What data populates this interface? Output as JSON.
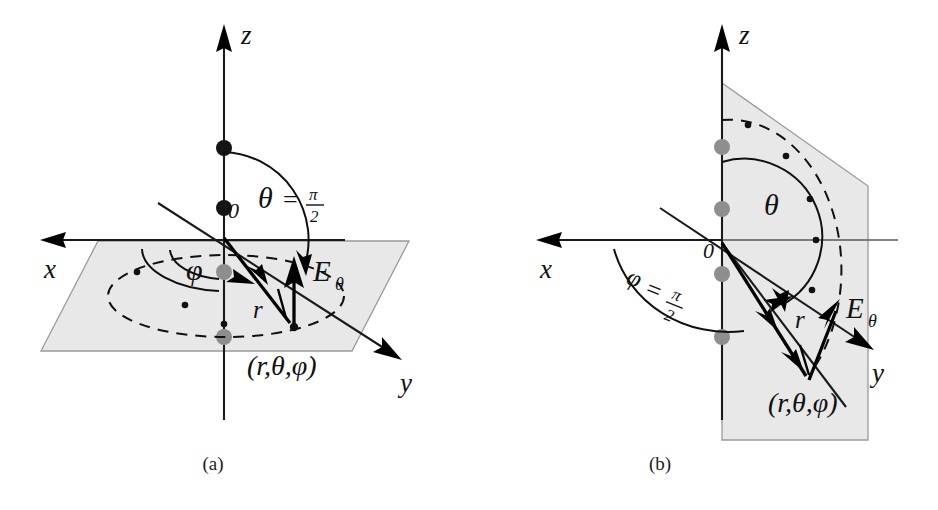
{
  "figure": {
    "background_color": "#ffffff",
    "plane_fill_color": "#e8e8e8",
    "plane_edge_color": "#9a9a9a",
    "ink_color": "#111111",
    "gray_dot_color": "#8e8e8e"
  },
  "panels": [
    {
      "id": "a",
      "caption": "(a)",
      "description": "Observation point in the equatorial (x-y) plane, theta = pi/2",
      "axes": [
        {
          "name": "z",
          "label": "z"
        },
        {
          "name": "x",
          "label": "x"
        },
        {
          "name": "y",
          "label": "y"
        }
      ],
      "origin_label": "0",
      "angles": [
        {
          "name": "theta",
          "symbol": "θ",
          "equals": "=",
          "value_numerator": "π",
          "value_denominator": "2",
          "full_text": "θ = π/2"
        },
        {
          "name": "phi",
          "symbol": "φ",
          "full_text": "φ"
        }
      ],
      "vectors": [
        {
          "name": "r",
          "label": "r"
        },
        {
          "name": "E_theta",
          "base": "E",
          "subscript": "θ",
          "full_text": "Eθ"
        }
      ],
      "point_label": "(r,θ,φ)",
      "dipole_dots_black": 2,
      "dipole_dots_gray": 2
    },
    {
      "id": "b",
      "caption": "(b)",
      "description": "Observation point in the y-z plane, phi = pi/2",
      "axes": [
        {
          "name": "z",
          "label": "z"
        },
        {
          "name": "x",
          "label": "x"
        },
        {
          "name": "y",
          "label": "y"
        }
      ],
      "origin_label": "0",
      "angles": [
        {
          "name": "theta",
          "symbol": "θ",
          "full_text": "θ"
        },
        {
          "name": "phi",
          "symbol": "φ",
          "equals": "=",
          "value_numerator": "π",
          "value_denominator": "2",
          "full_text": "φ = π/2"
        }
      ],
      "vectors": [
        {
          "name": "r",
          "label": "r"
        },
        {
          "name": "E_theta",
          "base": "E",
          "subscript": "θ",
          "full_text": "Eθ"
        }
      ],
      "point_label": "(r,θ,φ)",
      "dipole_dots_gray": 4
    }
  ]
}
